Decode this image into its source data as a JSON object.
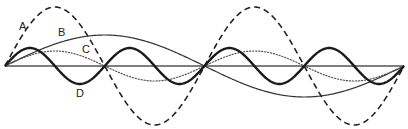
{
  "diagram": {
    "type": "standing-wave-harmonics",
    "axis": {
      "x_start": 5,
      "x_end": 404,
      "y": 66,
      "color": "#555555"
    },
    "waves": [
      {
        "id": "A",
        "label": "A",
        "style": "dashed",
        "amplitude": 59,
        "half_cycles": 4,
        "stroke_width": 1.6,
        "color": "#222222",
        "label_pos": [
          19,
          30
        ]
      },
      {
        "id": "B",
        "label": "B",
        "style": "solid-thin",
        "amplitude": 31,
        "half_cycles": 2,
        "stroke_width": 1.2,
        "color": "#333333",
        "label_pos": [
          58,
          36
        ]
      },
      {
        "id": "C",
        "label": "C",
        "style": "dotted",
        "amplitude": 15,
        "half_cycles": 4,
        "stroke_width": 1.2,
        "color": "#555555",
        "label_pos": [
          82,
          53
        ]
      },
      {
        "id": "D",
        "label": "D",
        "style": "solid-thick",
        "amplitude": 18,
        "half_cycles": 8,
        "stroke_width": 2.4,
        "color": "#1a1a1a",
        "label_pos": [
          76,
          97
        ]
      }
    ]
  }
}
